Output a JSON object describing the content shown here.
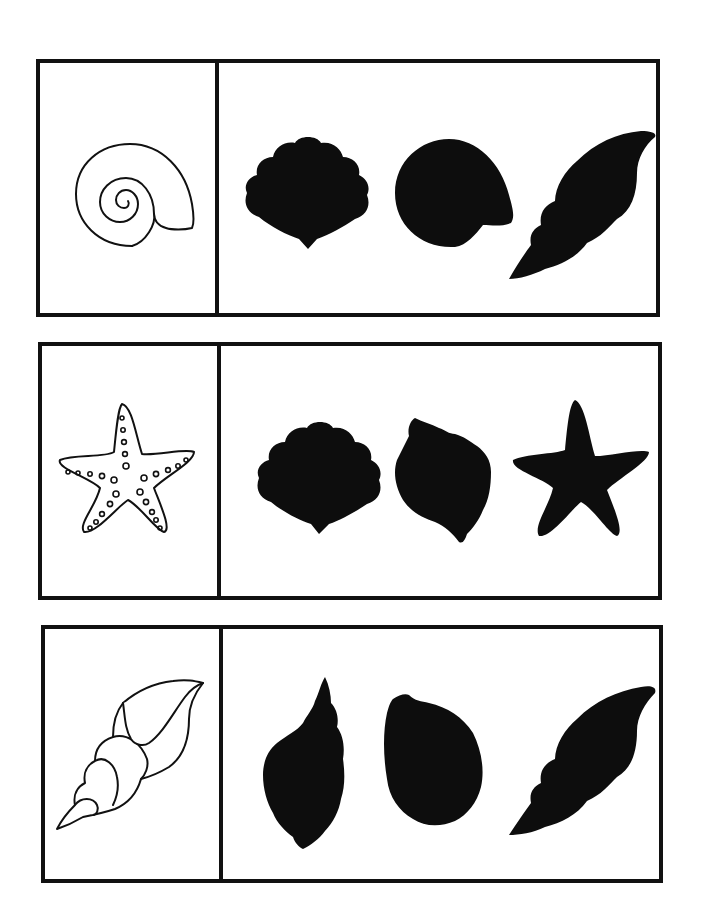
{
  "worksheet": {
    "type": "shadow-matching",
    "colors": {
      "line": "#111111",
      "silhouette": "#0d0d0d",
      "background": "#ffffff"
    },
    "rows": [
      {
        "prompt": {
          "icon": "snail-shell-spiral-icon",
          "label": "spiral snail shell"
        },
        "options": [
          {
            "icon": "scallop-shell-silhouette-icon",
            "label": "scallop shell shadow"
          },
          {
            "icon": "snail-shell-silhouette-icon",
            "label": "snail shell shadow"
          },
          {
            "icon": "conch-shell-silhouette-icon",
            "label": "conch shell shadow"
          }
        ]
      },
      {
        "prompt": {
          "icon": "starfish-outline-icon",
          "label": "dotted starfish"
        },
        "options": [
          {
            "icon": "scallop-shell-silhouette-icon",
            "label": "scallop shell shadow"
          },
          {
            "icon": "whelk-shell-silhouette-icon",
            "label": "whelk shell shadow"
          },
          {
            "icon": "starfish-silhouette-icon",
            "label": "starfish shadow"
          }
        ]
      },
      {
        "prompt": {
          "icon": "conch-shell-outline-icon",
          "label": "conch shell"
        },
        "options": [
          {
            "icon": "spindle-shell-silhouette-icon",
            "label": "spindle shell shadow"
          },
          {
            "icon": "cowrie-shell-silhouette-icon",
            "label": "teardrop shell shadow"
          },
          {
            "icon": "conch-shell-silhouette-icon",
            "label": "conch shell shadow"
          }
        ]
      }
    ]
  }
}
